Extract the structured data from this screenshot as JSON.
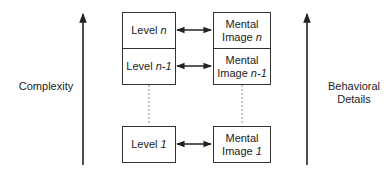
{
  "axes": {
    "left": {
      "label": "Complexity",
      "direction": "up"
    },
    "right": {
      "label_line1": "Behavioral",
      "label_line2": "Details",
      "direction": "up"
    }
  },
  "levels": [
    {
      "prefix": "Level ",
      "var": "n"
    },
    {
      "prefix": "Level ",
      "var": "n-1"
    },
    {
      "prefix": "Level ",
      "var": "1"
    }
  ],
  "mental_images": [
    {
      "line1": "Mental",
      "prefix": "Image ",
      "var": "n"
    },
    {
      "line1": "Mental",
      "prefix": "Image ",
      "var": "n-1"
    },
    {
      "line1": "Mental",
      "prefix": "Image ",
      "var": "1"
    }
  ],
  "connections": [
    {
      "from": "Level n",
      "to": "Mental Image n",
      "type": "bidirectional"
    },
    {
      "from": "Level n-1",
      "to": "Mental Image n-1",
      "type": "bidirectional"
    },
    {
      "from": "Level 1",
      "to": "Mental Image 1",
      "type": "bidirectional"
    }
  ],
  "colors": {
    "stroke": "#222222",
    "dashed": "#888888",
    "background": "#ffffff"
  }
}
